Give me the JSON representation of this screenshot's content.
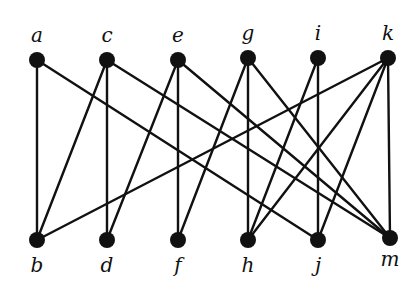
{
  "diagram": {
    "type": "bipartite-graph",
    "colors": {
      "ink": "#111111",
      "background": "#ffffff"
    },
    "top_nodes": [
      {
        "id": "a",
        "label": "a",
        "x": 37,
        "y": 60,
        "label_y": 42
      },
      {
        "id": "c",
        "label": "c",
        "x": 107,
        "y": 60,
        "label_y": 42
      },
      {
        "id": "e",
        "label": "e",
        "x": 178,
        "y": 60,
        "label_y": 42
      },
      {
        "id": "g",
        "label": "g",
        "x": 248,
        "y": 58,
        "label_y": 40
      },
      {
        "id": "i",
        "label": "i",
        "x": 318,
        "y": 58,
        "label_y": 40
      },
      {
        "id": "k",
        "label": "k",
        "x": 388,
        "y": 58,
        "label_y": 40
      }
    ],
    "bottom_nodes": [
      {
        "id": "b",
        "label": "b",
        "x": 37,
        "y": 240,
        "label_y": 272
      },
      {
        "id": "d",
        "label": "d",
        "x": 107,
        "y": 240,
        "label_y": 272
      },
      {
        "id": "f",
        "label": "f",
        "x": 178,
        "y": 240,
        "label_y": 272
      },
      {
        "id": "h",
        "label": "h",
        "x": 248,
        "y": 240,
        "label_y": 272
      },
      {
        "id": "j",
        "label": "j",
        "x": 318,
        "y": 240,
        "label_y": 272
      },
      {
        "id": "m",
        "label": "m",
        "x": 390,
        "y": 238,
        "label_y": 266
      }
    ],
    "edges": [
      [
        "a",
        "b"
      ],
      [
        "a",
        "j"
      ],
      [
        "c",
        "b"
      ],
      [
        "c",
        "d"
      ],
      [
        "c",
        "m"
      ],
      [
        "e",
        "d"
      ],
      [
        "e",
        "f"
      ],
      [
        "e",
        "m"
      ],
      [
        "g",
        "f"
      ],
      [
        "g",
        "h"
      ],
      [
        "g",
        "m"
      ],
      [
        "i",
        "h"
      ],
      [
        "i",
        "j"
      ],
      [
        "k",
        "b"
      ],
      [
        "k",
        "h"
      ],
      [
        "k",
        "j"
      ],
      [
        "k",
        "m"
      ]
    ]
  }
}
